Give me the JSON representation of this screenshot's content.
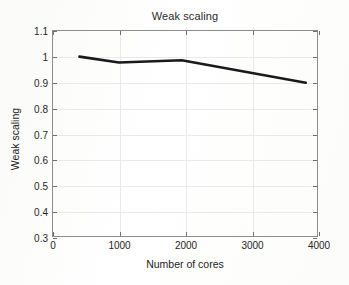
{
  "figure": {
    "title": "Weak scaling",
    "background_color": "#fdfdfd",
    "axes_color": "#8d8d8d",
    "grid_color": "#e9e9e9"
  },
  "axis_titles": {
    "x": "Number of cores",
    "y": "Weak scaling"
  },
  "ticks": {
    "x": [
      "0",
      "1000",
      "2000",
      "3000",
      "4000"
    ],
    "y": [
      "0.3",
      "0.4",
      "0.5",
      "0.6",
      "0.7",
      "0.8",
      "0.9",
      "1",
      "1.1"
    ]
  },
  "chart_data": {
    "type": "line",
    "title": "Weak scaling",
    "xlabel": "Number of cores",
    "ylabel": "Weak scaling",
    "xlim": [
      0,
      4000
    ],
    "ylim": [
      0.3,
      1.1
    ],
    "xticks": [
      0,
      1000,
      2000,
      3000,
      4000
    ],
    "yticks": [
      0.3,
      0.4,
      0.5,
      0.6,
      0.7,
      0.8,
      0.9,
      1.0,
      1.1
    ],
    "grid": true,
    "legend": null,
    "line_color": "#1a1a1a",
    "line_width": 2.6,
    "series": [
      {
        "name": "Weak scaling",
        "x": [
          400,
          1000,
          1950,
          3830
        ],
        "y": [
          1.0,
          0.977,
          0.986,
          0.898
        ]
      }
    ]
  }
}
